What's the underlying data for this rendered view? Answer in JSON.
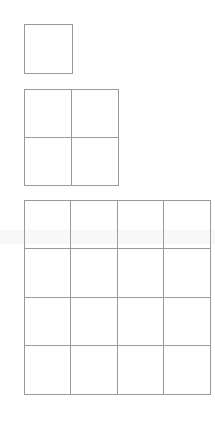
{
  "diagram": {
    "title": "",
    "line_color": "#9a9a9a",
    "background": "#ffffff",
    "grids": [
      {
        "name": "grid-1x1",
        "rows": 1,
        "cols": 1,
        "left": 24,
        "top": 24,
        "width": 49,
        "height": 50
      },
      {
        "name": "grid-2x2",
        "rows": 2,
        "cols": 2,
        "left": 24,
        "top": 89,
        "width": 95,
        "height": 97
      },
      {
        "name": "grid-4x4",
        "rows": 4,
        "cols": 4,
        "left": 24,
        "top": 200,
        "width": 187,
        "height": 195
      }
    ]
  }
}
